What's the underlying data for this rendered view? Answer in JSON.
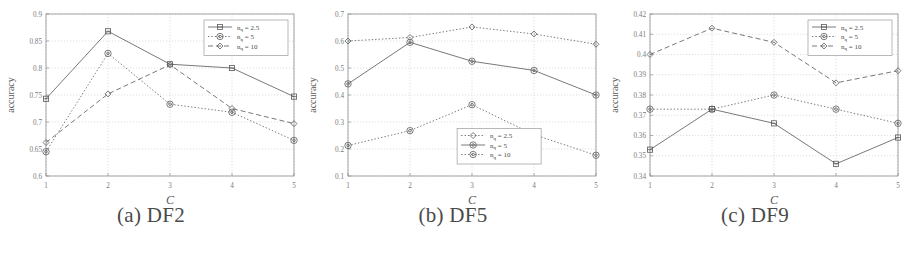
{
  "figure": {
    "ylabel": "accuracy",
    "xlabel": "C",
    "xticks": [
      "1",
      "2",
      "3",
      "4",
      "5"
    ]
  },
  "panels": [
    {
      "caption": "(a) DF2",
      "yticks": [
        "0.6",
        "0.65",
        "0.7",
        "0.75",
        "0.8",
        "0.85",
        "0.9"
      ],
      "legend_position": "top-right",
      "legend": [
        "n_q = 2.5",
        "n_q = 5",
        "n_q = 10"
      ]
    },
    {
      "caption": "(b) DF5",
      "yticks": [
        "0.1",
        "0.2",
        "0.3",
        "0.4",
        "0.5",
        "0.6",
        "0.7"
      ],
      "legend_position": "bottom-center",
      "legend": [
        "n_q = 2.5",
        "n_q = 5",
        "n_q = 10"
      ]
    },
    {
      "caption": "(c) DF9",
      "yticks": [
        "0.34",
        "0.35",
        "0.36",
        "0.37",
        "0.38",
        "0.39",
        "0.4",
        "0.41",
        "0.42"
      ],
      "legend_position": "top-right",
      "legend": [
        "n_q = 2.5",
        "n_q = 5",
        "n_q = 10"
      ]
    }
  ],
  "chart_data": [
    {
      "type": "line",
      "title": "(a) DF2",
      "xlabel": "C",
      "ylabel": "accuracy",
      "x": [
        1,
        2,
        3,
        4,
        5
      ],
      "xlim": [
        1,
        5
      ],
      "ylim": [
        0.6,
        0.9
      ],
      "yticks": [
        0.6,
        0.65,
        0.7,
        0.75,
        0.8,
        0.85,
        0.9
      ],
      "grid": true,
      "legend_position": "top-right",
      "series": [
        {
          "name": "n_q = 2.5",
          "values": [
            0.743,
            0.868,
            0.807,
            0.8,
            0.747
          ],
          "style": "solid",
          "marker": "square"
        },
        {
          "name": "n_q = 5",
          "values": [
            0.645,
            0.827,
            0.733,
            0.718,
            0.666
          ],
          "style": "dotted",
          "marker": "circle"
        },
        {
          "name": "n_q = 10",
          "values": [
            0.662,
            0.752,
            0.806,
            0.725,
            0.697
          ],
          "style": "dashed",
          "marker": "diamond"
        }
      ]
    },
    {
      "type": "line",
      "title": "(b) DF5",
      "xlabel": "C",
      "ylabel": "accuracy",
      "x": [
        1,
        2,
        3,
        4,
        5
      ],
      "xlim": [
        1,
        5
      ],
      "ylim": [
        0.1,
        0.7
      ],
      "yticks": [
        0.1,
        0.2,
        0.3,
        0.4,
        0.5,
        0.6,
        0.7
      ],
      "grid": true,
      "legend_position": "bottom-center",
      "series": [
        {
          "name": "n_q = 2.5",
          "values": [
            0.6,
            0.613,
            0.652,
            0.626,
            0.588
          ],
          "style": "dotted",
          "marker": "diamond"
        },
        {
          "name": "n_q = 5",
          "values": [
            0.441,
            0.595,
            0.525,
            0.491,
            0.4
          ],
          "style": "solid",
          "marker": "circle"
        },
        {
          "name": "n_q = 10",
          "values": [
            0.213,
            0.268,
            0.364,
            0.253,
            0.177
          ],
          "style": "dotted",
          "marker": "circle"
        }
      ]
    },
    {
      "type": "line",
      "title": "(c) DF9",
      "xlabel": "C",
      "ylabel": "accuracy",
      "x": [
        1,
        2,
        3,
        4,
        5
      ],
      "xlim": [
        1,
        5
      ],
      "ylim": [
        0.34,
        0.42
      ],
      "yticks": [
        0.34,
        0.35,
        0.36,
        0.37,
        0.38,
        0.39,
        0.4,
        0.41,
        0.42
      ],
      "grid": true,
      "legend_position": "top-right",
      "series": [
        {
          "name": "n_q = 2.5",
          "values": [
            0.353,
            0.373,
            0.366,
            0.346,
            0.359
          ],
          "style": "solid",
          "marker": "square"
        },
        {
          "name": "n_q = 5",
          "values": [
            0.373,
            0.373,
            0.38,
            0.373,
            0.366
          ],
          "style": "dotted",
          "marker": "circle"
        },
        {
          "name": "n_q = 10",
          "values": [
            0.4,
            0.413,
            0.406,
            0.386,
            0.392
          ],
          "style": "dashed",
          "marker": "diamond"
        }
      ]
    }
  ]
}
